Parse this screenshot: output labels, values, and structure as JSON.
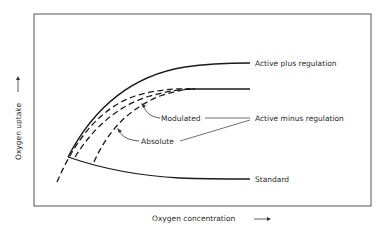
{
  "diagram": {
    "type": "line-schematic",
    "x_axis": {
      "label": "Oxygen  concentration",
      "arrow": "right-arrow"
    },
    "y_axis": {
      "label": "Oxygen  uptake",
      "arrow": "up-arrow"
    },
    "curves": [
      {
        "id": "active-plus-regulation",
        "label": "Active  plus  regulation",
        "style": "solid"
      },
      {
        "id": "active-minus-regulation",
        "label": "Active  minus  regulation",
        "style": "solid"
      },
      {
        "id": "modulated",
        "label": "Modulated",
        "style": "dashed"
      },
      {
        "id": "absolute",
        "label": "Absolute",
        "style": "dashed"
      },
      {
        "id": "standard",
        "label": "Standard",
        "style": "solid"
      }
    ],
    "colors": {
      "line": "#1a1a1a",
      "frame": "#555555",
      "text": "#2a2a2a"
    }
  }
}
